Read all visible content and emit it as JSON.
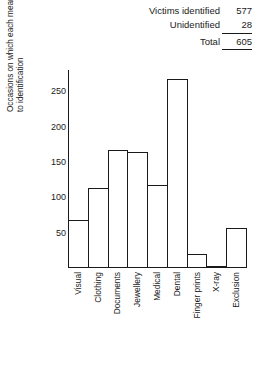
{
  "summary": {
    "rows": [
      {
        "label": "Victims identified",
        "value": "577"
      },
      {
        "label": "Unidentified",
        "value": "28"
      },
      {
        "label": "Total",
        "value": "605"
      }
    ]
  },
  "chart_data": {
    "type": "bar",
    "title": "",
    "xlabel": "",
    "ylabel": "Occasions on which each means contributed to identification",
    "ylabel_lines": [
      "Occasions on which each means contributed",
      "to identification"
    ],
    "categories": [
      "Visual",
      "Clothing",
      "Documents",
      "Jewellery",
      "Medical",
      "Dental",
      "Finger prints",
      "X-ray",
      "Exclusion"
    ],
    "values": [
      68,
      113,
      167,
      164,
      118,
      268,
      20,
      3,
      57
    ],
    "ylim": [
      0,
      280
    ],
    "yticks": [
      50,
      100,
      150,
      200,
      250
    ],
    "ytick_labels": [
      "50",
      "100",
      "150",
      "200",
      "250"
    ],
    "grid": false,
    "legend": null
  }
}
